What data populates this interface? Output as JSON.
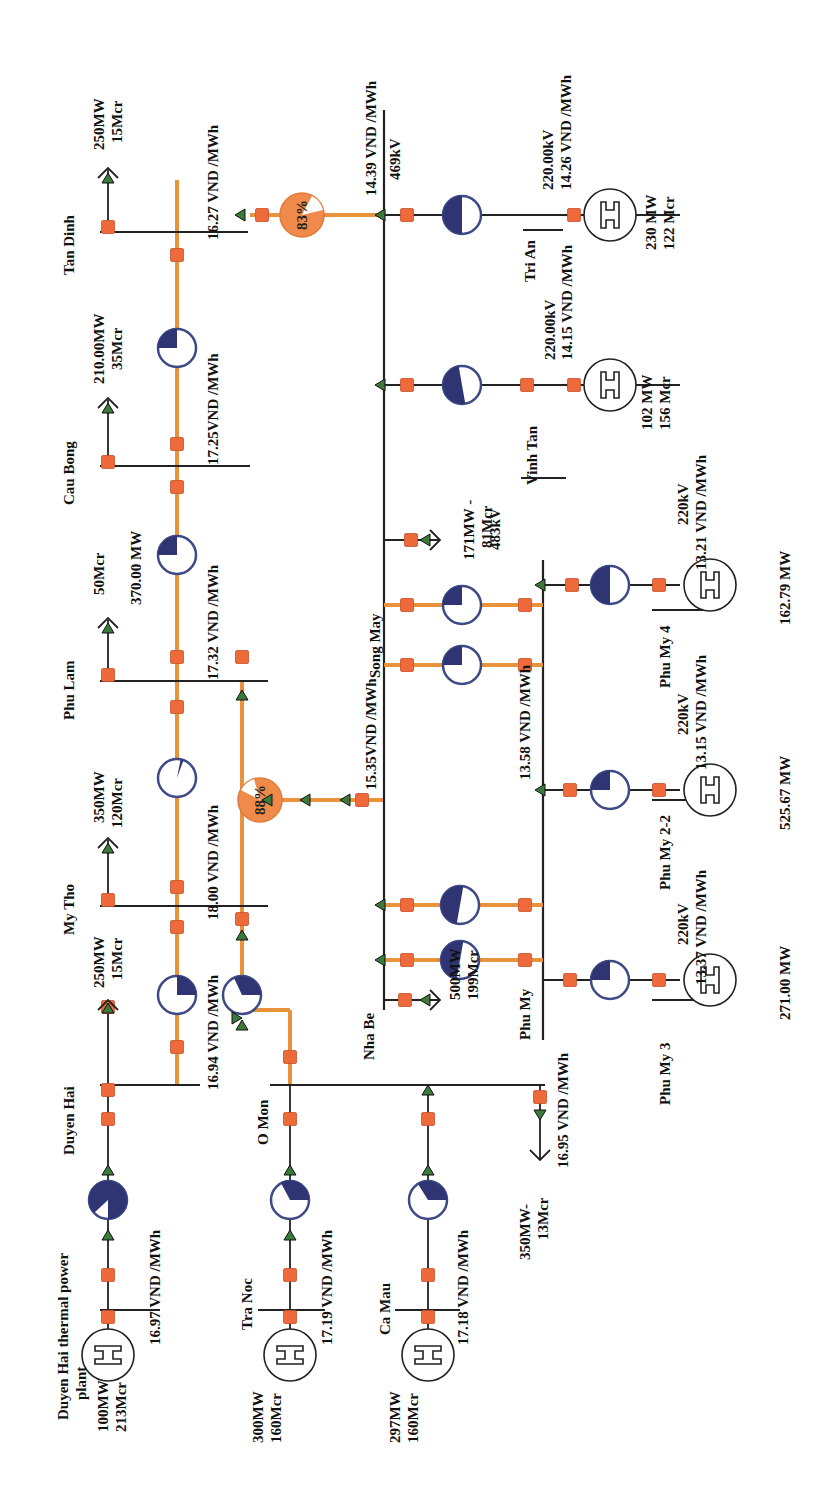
{
  "diagram": {
    "orientation": "rotated-90-ccw",
    "colors": {
      "line_loaded": "#e8923c",
      "breaker": "#ef6a3a",
      "flow_arrow": "#3c7a3c",
      "transformer": "#2f3472",
      "overloaded_transformer": "#f08a4b",
      "bus": "#222222"
    }
  },
  "buses": {
    "tan_dinh": {
      "name": "Tan Dinh",
      "price": "16.27 VND /MWh",
      "load": "250MW",
      "load_q": "15Mcr"
    },
    "cau_bong": {
      "name": "Cau Bong",
      "price": "17.25VND /MWh",
      "load": "210.00MW",
      "load_q": "35Mcr"
    },
    "phu_lam": {
      "name": "Phu Lam",
      "price": "17.32 VND /MWh",
      "load": "370.00 MW",
      "load_q": "50Mcr"
    },
    "my_tho": {
      "name": "My Tho",
      "price": "18.00 VND /MWh",
      "load": "350MW",
      "load_q": "120Mcr"
    },
    "duyen_hai": {
      "name": "Duyen Hai",
      "price": "16.94 VND /MWh",
      "load": "250MW",
      "load_q": "15Mcr"
    },
    "o_mon": {
      "name": "O Mon",
      "price": "16.95 VND /MWh",
      "load": "350MW-",
      "load_q": "13Mcr"
    },
    "nha_be": {
      "name": "Nha Be",
      "price": "15.35VND /MWh",
      "load": "500MW",
      "load_q": "199Mcr"
    },
    "phu_my": {
      "name": "Phu My",
      "price": "13.58 VND /MWh"
    },
    "song_may": {
      "name": "Song May",
      "price": "14.39 VND /MWh",
      "voltage": "469kV",
      "load": "171MW -",
      "load_q": "81Mcr"
    },
    "song_may_south": {
      "voltage": "483kV"
    }
  },
  "generators": {
    "duyen_hai_tpp": {
      "name_line1": "Duyen Hai thermal power",
      "name_line2": "plant",
      "p": "100MW",
      "q": "213Mcr",
      "price": "16.97 VND /MWh"
    },
    "tra_noc": {
      "name": "Tra Noc",
      "p": "300MW",
      "q": "160Mcr",
      "price": "17.19 VND /MWh"
    },
    "ca_mau": {
      "name": "Ca Mau",
      "p": "297MW",
      "q": "160Mcr",
      "price": "17.18 VND /MWh"
    },
    "phu_my_3": {
      "name": "Phu My 3",
      "voltage": "220kV",
      "price": "13.37 VND /MWh",
      "p": "271.00 MW"
    },
    "phu_my_2_2": {
      "name": "Phu My 2-2",
      "voltage": "220kV",
      "price": "13.15 VND /MWh",
      "p": "525.67 MW"
    },
    "phu_my_4": {
      "name": "Phu My 4",
      "voltage": "220kV",
      "price": "13.21 VND /MWh",
      "p": "162.79  MW"
    },
    "vinh_tan": {
      "name": "Vinh Tan",
      "voltage": "220.00kV",
      "price": "14.15 VND /MWh",
      "p": "102 MW",
      "q": "156 Mcr"
    },
    "tri_an": {
      "name": "Tri An",
      "voltage": "220.00kV",
      "price": "14.26 VND /MWh",
      "p": "230 MW",
      "q": "122 Mcr"
    }
  },
  "transformers": {
    "pct_83": "83%",
    "pct_88": "88%"
  }
}
